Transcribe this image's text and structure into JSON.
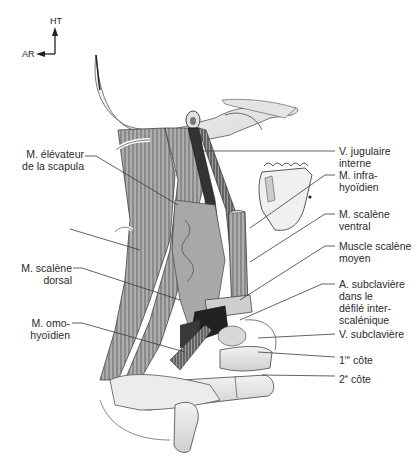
{
  "orientation": {
    "up_label": "HT",
    "left_label": "AR"
  },
  "labels_left": [
    {
      "id": "elevateur",
      "line1": "M. élévateur",
      "line2": "de la scapula"
    },
    {
      "id": "scalene_dorsal",
      "line1": "M. scalène",
      "line2": "dorsal"
    },
    {
      "id": "omohyoidien",
      "line1": "M. omo-",
      "line2": "hyoïdien"
    }
  ],
  "labels_right": [
    {
      "id": "jugulaire",
      "lines": [
        "V. jugulaire",
        "interne"
      ]
    },
    {
      "id": "infrahyoidien",
      "lines": [
        "M. infra-",
        "hyoïdien"
      ]
    },
    {
      "id": "scalene_ventral",
      "lines": [
        "M. scalène",
        "ventral"
      ]
    },
    {
      "id": "scalene_moyen",
      "lines": [
        "Muscle scalène",
        "moyen"
      ]
    },
    {
      "id": "subclaviere_a",
      "lines": [
        "A. subclavière",
        "dans le",
        "défilé inter-",
        "scalénique"
      ]
    },
    {
      "id": "subclaviere_v",
      "lines": [
        "V. subclavière"
      ]
    },
    {
      "id": "cote1",
      "num": "1",
      "sup": "re",
      "text": " côte"
    },
    {
      "id": "cote2",
      "num": "2",
      "sup": "e",
      "text": " côte"
    }
  ],
  "colors": {
    "ink": "#2a2a2a",
    "muscle_dark": "#5a5a5a",
    "muscle_mid": "#8a8a8a",
    "bone": "#e6e6e6",
    "vessel": "#1e1e1e"
  }
}
